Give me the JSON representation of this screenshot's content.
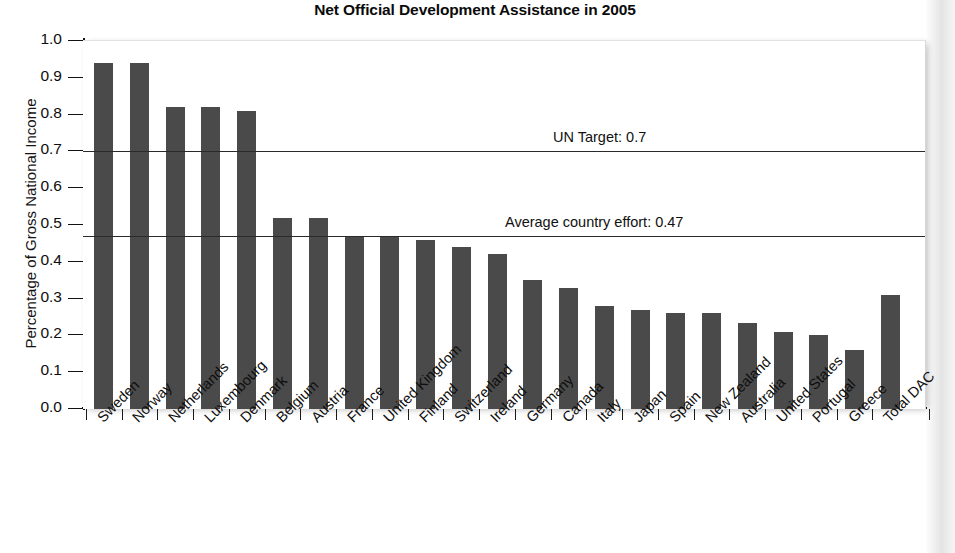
{
  "chart_data": {
    "type": "bar",
    "title": "Net Official Development Assistance in 2005",
    "xlabel": "",
    "ylabel": "Percentage of Gross National Income",
    "ylim": [
      0.0,
      1.0
    ],
    "ytick_labels": [
      "1.0",
      "0.9",
      "0.8",
      "0.7",
      "0.6",
      "0.5",
      "0.4",
      "0.3",
      "0.2",
      "0.1",
      "0.0"
    ],
    "ytick_values": [
      1.0,
      0.9,
      0.8,
      0.7,
      0.6,
      0.5,
      0.4,
      0.3,
      0.2,
      0.1,
      0.0
    ],
    "grid": false,
    "legend": "none",
    "bar_color": "#4a4a4a",
    "categories": [
      "Sweden",
      "Norway",
      "Netherlands",
      "Luxembourg",
      "Denmark",
      "Belgium",
      "Austria",
      "France",
      "United Kingdom",
      "Finland",
      "Switzerland",
      "Ireland",
      "Germany",
      "Canada",
      "Italy",
      "Japan",
      "Spain",
      "New Zealand",
      "Australia",
      "United States",
      "Portugal",
      "Greece",
      "Total DAC"
    ],
    "values": [
      0.94,
      0.94,
      0.82,
      0.82,
      0.81,
      0.52,
      0.52,
      0.47,
      0.47,
      0.46,
      0.44,
      0.42,
      0.35,
      0.33,
      0.28,
      0.27,
      0.26,
      0.26,
      0.235,
      0.21,
      0.2,
      0.16,
      0.31
    ],
    "annotations": [
      {
        "label": "UN Target: 0.7",
        "value": 0.7
      },
      {
        "label": "Average country effort: 0.47",
        "value": 0.47
      }
    ]
  },
  "footer": {
    "text": ""
  }
}
